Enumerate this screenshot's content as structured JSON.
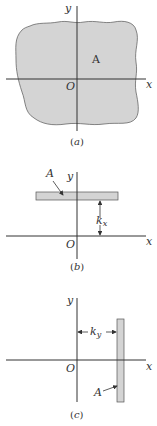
{
  "figure": {
    "panels": [
      {
        "id": "a",
        "caption": "(a)",
        "caption_letter": "a",
        "axis_x_label": "x",
        "axis_y_label": "y",
        "origin_label": "O",
        "area_label": "A",
        "shape": "irregular-area"
      },
      {
        "id": "b",
        "caption": "(b)",
        "caption_letter": "b",
        "axis_x_label": "x",
        "axis_y_label": "y",
        "origin_label": "O",
        "area_label": "A",
        "dimension_label": "k",
        "dimension_subscript": "x",
        "shape": "horizontal-strip"
      },
      {
        "id": "c",
        "caption": "(c)",
        "caption_letter": "c",
        "axis_x_label": "x",
        "axis_y_label": "y",
        "origin_label": "O",
        "area_label": "A",
        "dimension_label": "k",
        "dimension_subscript": "y",
        "shape": "vertical-strip"
      }
    ],
    "colors": {
      "area_fill": "#d4d4d4",
      "line": "#333333"
    }
  }
}
